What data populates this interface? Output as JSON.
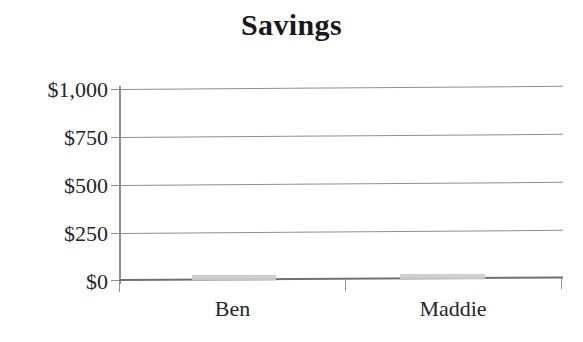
{
  "chart_data": {
    "type": "bar",
    "title": "Savings",
    "xlabel": "",
    "ylabel": "",
    "categories": [
      "Ben",
      "Maddie"
    ],
    "values": [
      20,
      20
    ],
    "value_prefix": "$",
    "ylim": [
      0,
      1000
    ],
    "yticks": [
      0,
      250,
      500,
      750,
      1000
    ],
    "ytick_labels": [
      "$0",
      "$250",
      "$500",
      "$750",
      "$1,000"
    ],
    "grid": true,
    "legend": false,
    "legend_position": "none",
    "series": [
      {
        "name": "Savings",
        "values": [
          20,
          20
        ],
        "color": "#c6c7c9"
      }
    ],
    "annotations": []
  },
  "axis": {
    "y_labels": [
      {
        "text": "$1,000",
        "value": 1000
      },
      {
        "text": "$750",
        "value": 750
      },
      {
        "text": "$500",
        "value": 500
      },
      {
        "text": "$250",
        "value": 250
      },
      {
        "text": "$0",
        "value": 0
      }
    ],
    "x_labels": [
      {
        "text": "Ben"
      },
      {
        "text": "Maddie"
      }
    ]
  },
  "colors": {
    "bar_fill": "#c6c7c9",
    "gridline": "#8d8f93",
    "axis": "#6e7073",
    "text": "#252527",
    "title": "#18181a",
    "background": "#ffffff"
  }
}
